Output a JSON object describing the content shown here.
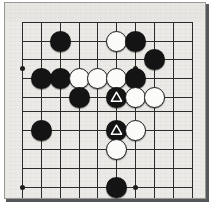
{
  "diagram": {
    "kind": "go-board-diagram",
    "title": "Go board position",
    "board": {
      "columns": 10,
      "rows": 10,
      "cell_size_px": 18.8,
      "origin_x_px": 21,
      "origin_y_px": 21,
      "background_color": "#eceae6",
      "line_color": "#2b2b2b",
      "border_color": "#9a9894",
      "shadow_color": "#55585a",
      "top_margin_band_color": "#e8e6e2",
      "grid_visible": true
    },
    "star_points": [
      {
        "col": 1,
        "row": 3.45,
        "x": 21,
        "y": 67
      },
      {
        "col": 7,
        "row": 3.45,
        "x": 134,
        "y": 67
      },
      {
        "col": 1,
        "row": 9.78,
        "x": 21,
        "y": 186
      },
      {
        "col": 7,
        "row": 9.78,
        "x": 134,
        "y": 186
      }
    ],
    "stone_colors": {
      "black_fill": "#141414",
      "white_fill": "#fbfbfa",
      "white_outline": "#1b1b1b",
      "triangle_mark_color": "#ffffff"
    },
    "stones": [
      {
        "id": "b1",
        "color": "black",
        "mark": "none",
        "x": 59,
        "y": 40
      },
      {
        "id": "w1",
        "color": "white",
        "mark": "none",
        "x": 115,
        "y": 40
      },
      {
        "id": "b2",
        "color": "black",
        "mark": "none",
        "x": 134,
        "y": 40
      },
      {
        "id": "b3",
        "color": "black",
        "mark": "none",
        "x": 153,
        "y": 58
      },
      {
        "id": "b4",
        "color": "black",
        "mark": "none",
        "x": 40,
        "y": 77
      },
      {
        "id": "b5",
        "color": "black",
        "mark": "none",
        "x": 59,
        "y": 77
      },
      {
        "id": "w2",
        "color": "white",
        "mark": "none",
        "x": 78,
        "y": 77
      },
      {
        "id": "w3",
        "color": "white",
        "mark": "none",
        "x": 96,
        "y": 77
      },
      {
        "id": "w4",
        "color": "white",
        "mark": "none",
        "x": 115,
        "y": 77
      },
      {
        "id": "b6",
        "color": "black",
        "mark": "none",
        "x": 134,
        "y": 77
      },
      {
        "id": "b7",
        "color": "black",
        "mark": "none",
        "x": 78,
        "y": 96
      },
      {
        "id": "b8",
        "color": "black",
        "mark": "triangle",
        "x": 115,
        "y": 96
      },
      {
        "id": "w5",
        "color": "white",
        "mark": "none",
        "x": 134,
        "y": 96
      },
      {
        "id": "w6",
        "color": "white",
        "mark": "none",
        "x": 153,
        "y": 96
      },
      {
        "id": "b9",
        "color": "black",
        "mark": "none",
        "x": 40,
        "y": 129
      },
      {
        "id": "b10",
        "color": "black",
        "mark": "triangle",
        "x": 115,
        "y": 129
      },
      {
        "id": "w7",
        "color": "white",
        "mark": "none",
        "x": 134,
        "y": 129
      },
      {
        "id": "w8",
        "color": "white",
        "mark": "none",
        "x": 115,
        "y": 148
      },
      {
        "id": "b11",
        "color": "black",
        "mark": "none",
        "x": 115,
        "y": 186
      }
    ],
    "vertical_lines_x": [
      21,
      40,
      59,
      78,
      96,
      115,
      134,
      153,
      172,
      191
    ],
    "horizontal_lines_y": [
      21,
      40,
      58,
      77,
      96,
      110,
      129,
      148,
      167,
      186
    ],
    "grid_extent": {
      "x_start": 21,
      "x_end": 191,
      "y_start": 21,
      "y_end": 197
    },
    "summary": {
      "black_stone_count": 11,
      "white_stone_count": 8,
      "marked_stone_count": 2,
      "mark_symbol": "triangle"
    }
  }
}
